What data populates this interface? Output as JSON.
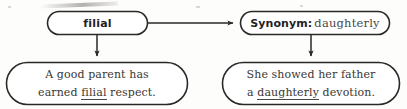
{
  "diagram": {
    "stroke_color": "#2b2927",
    "text_color": "#3a3734",
    "background_color": "#fdfdfc",
    "nodes": {
      "term": {
        "label": "filial",
        "style": "rounded-pill"
      },
      "synonym": {
        "label_bold": "Synonym:",
        "label_word": "daughterly",
        "style": "rounded-pill"
      },
      "example_left": {
        "line1": "A good parent has",
        "line2_before": "earned ",
        "line2_underlined": "filial",
        "line2_after": " respect.",
        "style": "rounded-pill"
      },
      "example_right": {
        "line1": "She showed her father",
        "line2_before": "a ",
        "line2_underlined": "daughterly",
        "line2_after": " devotion.",
        "style": "rounded-pill"
      }
    },
    "connectors": [
      {
        "name": "term-to-synonym",
        "direction": "horizontal-right",
        "from": "term",
        "to": "synonym"
      },
      {
        "name": "term-to-example-left",
        "direction": "vertical-down",
        "from": "term",
        "to": "example_left"
      },
      {
        "name": "synonym-to-example-right",
        "direction": "vertical-down",
        "from": "synonym",
        "to": "example_right"
      }
    ]
  }
}
